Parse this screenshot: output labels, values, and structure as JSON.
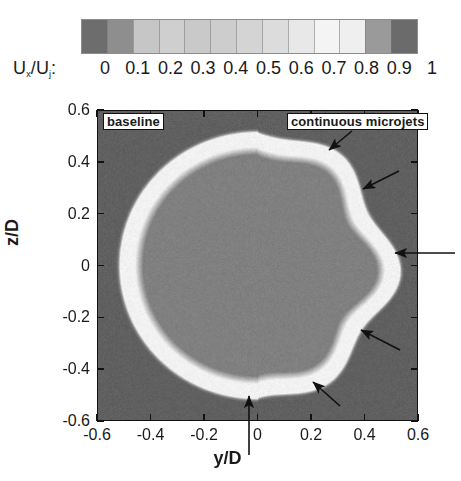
{
  "figure": {
    "type": "grayscale-flow-visualization-contour"
  },
  "colorbar": {
    "title_main": "U",
    "title_sub1": "x",
    "title_mid": "/U",
    "title_sub2": "j",
    "title_colon": ":",
    "title_plain": "Ux/Uj :",
    "orientation": "horizontal",
    "ticks": [
      "0",
      "0.1",
      "0.2",
      "0.3",
      "0.4",
      "0.5",
      "0.6",
      "0.7",
      "0.8",
      "0.9",
      "1"
    ],
    "swatch_colors": [
      "#6d6d6d",
      "#8e8e8e",
      "#c6c6c6",
      "#cfcfcf",
      "#c9c9c9",
      "#cdcdcd",
      "#d4d4d4",
      "#dcdcdc",
      "#e8e8e8",
      "#f4f4f4",
      "#efefef",
      "#9a9a9a",
      "#6b6b6b"
    ]
  },
  "axes": {
    "x_title": "y/D",
    "y_title": "z/D",
    "x_ticks": [
      "-0.6",
      "-0.4",
      "-0.2",
      "0",
      "0.2",
      "0.4",
      "0.6"
    ],
    "y_ticks": [
      "0.6",
      "0.4",
      "0.2",
      "0",
      "-0.2",
      "-0.4",
      "-0.6"
    ],
    "x_min": -0.6,
    "x_max": 0.6,
    "y_min": -0.6,
    "y_max": 0.6
  },
  "annotations": {
    "baseline_label": "baseline",
    "microjets_label": "continuous microjets",
    "arrow_count": 5,
    "arrow_meaning": "indentations of the shear layer produced by the microjets"
  },
  "chart_data": {
    "type": "heatmap",
    "title": "",
    "xlabel": "y/D",
    "ylabel": "z/D",
    "xlim": [
      -0.6,
      0.6
    ],
    "ylim": [
      -0.6,
      0.6
    ],
    "grid": false,
    "legend": "horizontal colorbar above plot",
    "colorbar_label": "Ux/Uj",
    "colorbar_range": [
      0,
      1
    ],
    "field_values": {
      "ambient_outside_jet": 0.05,
      "shear_layer_peak": 0.85,
      "jet_core": 0.45
    },
    "boundary_left_half": {
      "shape": "smooth circular",
      "radius_over_D": 0.49
    },
    "boundary_right_half": {
      "shape": "scalloped / lobed",
      "mean_radius_over_D": 0.47,
      "lobe_count": 6,
      "lobe_amplitude_over_D": 0.04
    },
    "arrow_targets": [
      {
        "y_over_D": 0.22,
        "z_over_D": 0.47
      },
      {
        "y_over_D": 0.41,
        "z_over_D": 0.3
      },
      {
        "y_over_D": 0.48,
        "z_over_D": 0.01
      },
      {
        "y_over_D": 0.4,
        "z_over_D": -0.24
      },
      {
        "y_over_D": 0.21,
        "z_over_D": -0.44
      },
      {
        "y_over_D": 0.01,
        "z_over_D": -0.5
      }
    ]
  }
}
